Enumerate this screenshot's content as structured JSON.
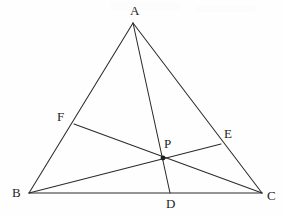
{
  "figure": {
    "name": "triangle-cevian-concurrency-diagram",
    "width": 282,
    "height": 215,
    "background_color": "#fefefe",
    "stroke_color": "#2b2b2b",
    "label_color": "#242424"
  },
  "points": {
    "A": {
      "label": "A",
      "x": 133,
      "y": 23,
      "label_x": 130,
      "label_y": 4
    },
    "B": {
      "label": "B",
      "x": 29,
      "y": 193,
      "label_x": 12,
      "label_y": 186
    },
    "C": {
      "label": "C",
      "x": 262,
      "y": 193,
      "label_x": 267,
      "label_y": 189
    },
    "D": {
      "label": "D",
      "x": 170,
      "y": 193,
      "label_x": 166,
      "label_y": 197
    },
    "E": {
      "label": "E",
      "x": 221,
      "y": 144,
      "label_x": 224,
      "label_y": 127
    },
    "F": {
      "label": "F",
      "x": 74,
      "y": 124,
      "label_x": 57,
      "label_y": 110
    },
    "P": {
      "label": "P",
      "x": 163,
      "y": 158,
      "label_x": 164,
      "label_y": 137
    }
  },
  "segments": [
    {
      "name": "side-ab",
      "from": "A",
      "to": "B",
      "kind": "triangle-side"
    },
    {
      "name": "side-bc",
      "from": "B",
      "to": "C",
      "kind": "triangle-side"
    },
    {
      "name": "side-ca",
      "from": "C",
      "to": "A",
      "kind": "triangle-side"
    },
    {
      "name": "cevian-ad",
      "from": "A",
      "to": "D",
      "kind": "cevian"
    },
    {
      "name": "cevian-be",
      "from": "B",
      "to": "E",
      "kind": "cevian"
    },
    {
      "name": "cevian-fc",
      "from": "F",
      "to": "C",
      "kind": "cevian"
    }
  ],
  "marked_points": [
    "P"
  ],
  "chart_data": {
    "type": "scatter",
    "title": "",
    "xlabel": "",
    "ylabel": "",
    "xlim": [
      0,
      282
    ],
    "ylim": [
      215,
      0
    ],
    "grid": false,
    "legend": "none",
    "annotations": [
      "A",
      "B",
      "C",
      "D",
      "E",
      "F",
      "P"
    ],
    "vertices": {
      "A": [
        133,
        23
      ],
      "B": [
        29,
        193
      ],
      "C": [
        262,
        193
      ],
      "D": [
        170,
        193
      ],
      "E": [
        221,
        144
      ],
      "F": [
        74,
        124
      ],
      "P": [
        163,
        158
      ]
    },
    "lines": [
      {
        "name": "AB",
        "x": [
          133,
          29
        ],
        "y": [
          23,
          193
        ]
      },
      {
        "name": "BC",
        "x": [
          29,
          262
        ],
        "y": [
          193,
          193
        ]
      },
      {
        "name": "CA",
        "x": [
          262,
          133
        ],
        "y": [
          193,
          23
        ]
      },
      {
        "name": "AD",
        "x": [
          133,
          170
        ],
        "y": [
          23,
          193
        ]
      },
      {
        "name": "BE",
        "x": [
          29,
          221
        ],
        "y": [
          193,
          144
        ]
      },
      {
        "name": "FC",
        "x": [
          74,
          262
        ],
        "y": [
          124,
          193
        ]
      }
    ]
  }
}
